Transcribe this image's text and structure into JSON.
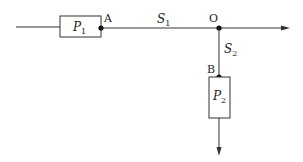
{
  "diagram": {
    "type": "flow-network",
    "nodes": [
      {
        "id": "A",
        "label": "A"
      },
      {
        "id": "O",
        "label": "O"
      },
      {
        "id": "B",
        "label": "B"
      }
    ],
    "blocks": [
      {
        "id": "P1",
        "symbol": "P",
        "subscript": "1"
      },
      {
        "id": "P2",
        "symbol": "P",
        "subscript": "2"
      }
    ],
    "segments": [
      {
        "id": "S1",
        "symbol": "S",
        "subscript": "1",
        "from": "A",
        "to": "O"
      },
      {
        "id": "S2",
        "symbol": "S",
        "subscript": "2",
        "from": "O",
        "to": "B"
      }
    ],
    "colors": {
      "line": "#333333",
      "dot": "#111111",
      "background": "#ffffff"
    }
  }
}
